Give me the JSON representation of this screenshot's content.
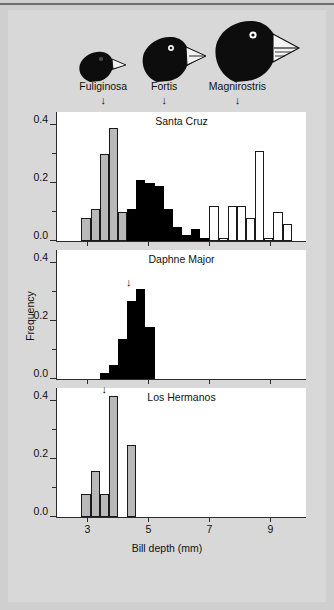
{
  "figure": {
    "background_color": "#d8d8d8",
    "page_background_color": "#cfcfcf"
  },
  "axes": {
    "xlabel": "Bill depth (mm)",
    "ylabel": "Frequency",
    "xticks": [
      3,
      5,
      7,
      9
    ],
    "xtick_labels": [
      "3",
      "5",
      "7",
      "9"
    ],
    "xlim": [
      2.0,
      10.2
    ],
    "yticks_major": [
      0.0,
      0.2,
      0.4
    ],
    "ytick_labels": [
      "0.0",
      "0.2",
      "0.4"
    ],
    "yticks_minor": [
      0.1,
      0.3,
      0.5
    ],
    "ylim": [
      0,
      0.5
    ]
  },
  "species_markers": [
    {
      "name": "fuliginosa-marker",
      "label": "Fuliginosa",
      "x": 3.55,
      "arrow": "↓"
    },
    {
      "name": "fortis-marker",
      "label": "Fortis",
      "x": 5.55,
      "arrow": "↓"
    },
    {
      "name": "magnirostris-marker",
      "label": "Magnirostris",
      "x": 7.95,
      "arrow": "↓"
    }
  ],
  "bird_illustrations": [
    {
      "name": "bird-fuliginosa",
      "species": "Geospiza fuliginosa",
      "size": "small"
    },
    {
      "name": "bird-fortis",
      "species": "Geospiza fortis",
      "size": "medium"
    },
    {
      "name": "bird-magnirostris",
      "species": "Geospiza magnirostris",
      "size": "large"
    }
  ],
  "colors": {
    "fuliginosa_fill": "#b9b9b9",
    "fortis_fill": "#000000",
    "magnirostris_fill": "#ffffff",
    "outline": "#1a1a1a",
    "axis": "#2b2b2b"
  },
  "chart_data": [
    {
      "type": "bar",
      "title": "Santa Cruz",
      "xlabel": "Bill depth (mm)",
      "ylabel": "Frequency",
      "xlim": [
        2.0,
        10.2
      ],
      "ylim": [
        0,
        0.45
      ],
      "grid": false,
      "legend": "none",
      "bin_width": 0.3,
      "arrows": [],
      "series": [
        {
          "name": "fuliginosa",
          "style": "gray-filled",
          "bins": [
            2.8,
            3.1,
            3.4,
            3.7,
            4.0,
            4.3
          ],
          "values": [
            0.08,
            0.11,
            0.3,
            0.39,
            0.1,
            0.02
          ]
        },
        {
          "name": "fortis",
          "style": "black-filled",
          "bins": [
            4.3,
            4.6,
            4.9,
            5.2,
            5.5,
            5.8,
            6.1,
            6.4,
            6.7
          ],
          "values": [
            0.11,
            0.21,
            0.2,
            0.19,
            0.11,
            0.05,
            0.02,
            0.04,
            0.01
          ]
        },
        {
          "name": "magnirostris",
          "style": "white-outline",
          "bins": [
            6.7,
            7.0,
            7.3,
            7.6,
            7.9,
            8.2,
            8.5,
            8.8,
            9.1,
            9.4
          ],
          "values": [
            0.01,
            0.12,
            0.01,
            0.12,
            0.12,
            0.08,
            0.31,
            0.01,
            0.1,
            0.06
          ]
        }
      ]
    },
    {
      "type": "bar",
      "title": "Daphne Major",
      "xlabel": "Bill depth (mm)",
      "ylabel": "Frequency",
      "xlim": [
        2.0,
        10.2
      ],
      "ylim": [
        0,
        0.45
      ],
      "grid": false,
      "legend": "none",
      "bin_width": 0.3,
      "arrows": [
        {
          "x": 4.35,
          "y": 0.31,
          "label": "mean-bill-depth-arrow"
        }
      ],
      "series": [
        {
          "name": "fortis",
          "style": "black-filled",
          "bins": [
            3.4,
            3.7,
            4.0,
            4.3,
            4.6,
            4.9
          ],
          "values": [
            0.02,
            0.05,
            0.14,
            0.27,
            0.31,
            0.18
          ]
        }
      ]
    },
    {
      "type": "bar",
      "title": "Los Hermanos",
      "xlabel": "Bill depth (mm)",
      "ylabel": "Frequency",
      "xlim": [
        2.0,
        10.2
      ],
      "ylim": [
        0,
        0.45
      ],
      "grid": false,
      "legend": "none",
      "bin_width": 0.3,
      "arrows": [
        {
          "x": 3.55,
          "y": 0.42,
          "label": "mean-bill-depth-arrow"
        }
      ],
      "series": [
        {
          "name": "fuliginosa",
          "style": "gray-filled",
          "bins": [
            2.8,
            3.1,
            3.4,
            3.7,
            4.3
          ],
          "values": [
            0.08,
            0.16,
            0.08,
            0.42,
            0.25
          ]
        }
      ]
    }
  ]
}
